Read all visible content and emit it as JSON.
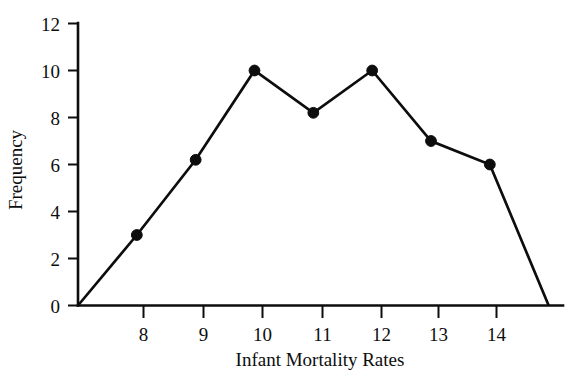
{
  "chart_data": {
    "type": "line",
    "title": "",
    "subtitle": "",
    "xlabel": "Infant Mortality Rates",
    "ylabel": "Frequency",
    "x": [
      7,
      8,
      9,
      10,
      11,
      12,
      13,
      14,
      15
    ],
    "values": [
      0,
      3,
      6.2,
      10,
      8.2,
      10,
      7,
      6,
      0
    ],
    "series": [
      {
        "name": "Frequency",
        "x": [
          7,
          8,
          9,
          10,
          11,
          12,
          13,
          14,
          15
        ],
        "values": [
          0,
          3,
          6.2,
          10,
          8.2,
          10,
          7,
          6,
          0
        ],
        "color": "#0d0d0d",
        "marker": "filled-circle",
        "markers_shown_at": [
          8,
          9,
          10,
          11,
          12,
          13,
          14
        ]
      }
    ],
    "xticks": [
      8,
      9,
      10,
      11,
      12,
      13,
      14
    ],
    "xtick_labels": [
      "8",
      "9",
      "10",
      "11",
      "12",
      "13",
      "14"
    ],
    "yticks": [
      0,
      2,
      4,
      6,
      8,
      10,
      12
    ],
    "ytick_labels": [
      "0",
      "2",
      "4",
      "6",
      "8",
      "10",
      "12"
    ],
    "xlim": [
      7,
      15.3
    ],
    "ylim": [
      0,
      12
    ],
    "grid": false,
    "legend": "none",
    "background_color": "#ffffff",
    "line_color": "#0d0d0d",
    "axis_color": "#0d0d0d"
  }
}
